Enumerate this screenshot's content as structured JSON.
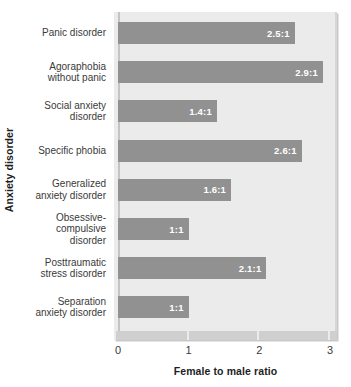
{
  "chart_data": {
    "type": "bar",
    "orientation": "horizontal",
    "title": "",
    "xlabel": "Female to male ratio",
    "ylabel": "Anxiety disorder",
    "xlim": [
      0,
      3
    ],
    "xticks": [
      "0",
      "1",
      "2",
      "3"
    ],
    "grid": false,
    "legend": null,
    "bar_color": "#919191",
    "plot_background": "#ebebeb",
    "categories": [
      "Panic disorder",
      "Agoraphobia\nwithout panic",
      "Social anxiety\ndisorder",
      "Specific phobia",
      "Generalized\nanxiety disorder",
      "Obsessive-\ncompulsive\ndisorder",
      "Posttraumatic\nstress disorder",
      "Separation\nanxiety disorder"
    ],
    "values": [
      2.5,
      2.9,
      1.4,
      2.6,
      1.6,
      1.0,
      2.1,
      1.0
    ],
    "data_labels": [
      "2.5:1",
      "2.9:1",
      "1.4:1",
      "2.6:1",
      "1.6:1",
      "1:1",
      "2.1:1",
      "1:1"
    ]
  }
}
